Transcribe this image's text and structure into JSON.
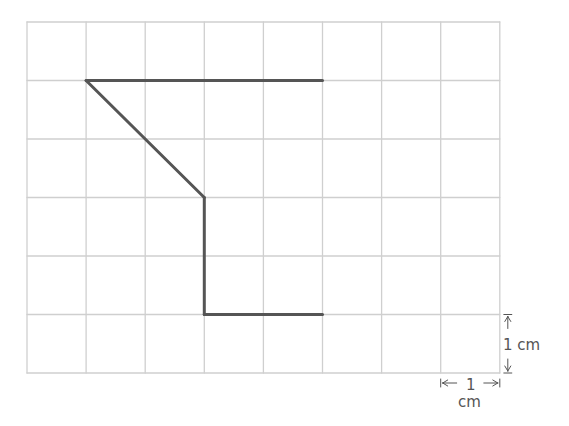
{
  "grid": {
    "cols": 8,
    "rows": 6,
    "origin_x": 27,
    "origin_y": 22,
    "cell_w": 59.1,
    "cell_h": 58.5,
    "line_color": "#cfcfcf"
  },
  "shape": {
    "color": "#555555",
    "segments": [
      {
        "from": [
          1,
          1
        ],
        "to": [
          5,
          1
        ]
      },
      {
        "from": [
          1,
          1
        ],
        "to": [
          3,
          3
        ]
      },
      {
        "from": [
          3,
          3
        ],
        "to": [
          3,
          5
        ]
      },
      {
        "from": [
          3,
          5
        ],
        "to": [
          5,
          5
        ]
      }
    ]
  },
  "scale": {
    "vertical_label": "1 cm",
    "horizontal_label_number": "1",
    "horizontal_label_unit": "cm",
    "color": "#555555"
  }
}
